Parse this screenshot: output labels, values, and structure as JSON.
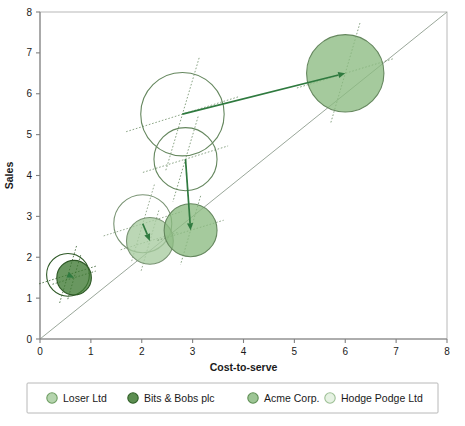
{
  "chart_data": {
    "type": "scatter",
    "title": "",
    "xlabel": "Cost-to-serve",
    "ylabel": "Sales",
    "xlim": [
      0,
      8
    ],
    "ylim": [
      0,
      8
    ],
    "xticks": [
      "0",
      "1",
      "2",
      "3",
      "4",
      "5",
      "6",
      "7",
      "8"
    ],
    "yticks": [
      "0",
      "1",
      "2",
      "3",
      "4",
      "5",
      "6",
      "7",
      "8"
    ],
    "grid": false,
    "legend_position": "bottom",
    "reference_line": {
      "name": "diagonal-parity-line",
      "from": [
        0,
        0
      ],
      "to": [
        8,
        8
      ],
      "color": "#9aa79a"
    },
    "series": [
      {
        "name": "Bits & Bobs plc",
        "color": "#3f7a33",
        "start": {
          "x": 0.55,
          "y": 1.57,
          "r": 0.42,
          "filled": false
        },
        "end": {
          "x": 0.67,
          "y": 1.5,
          "r": 0.34,
          "filled": true
        }
      },
      {
        "name": "Loser Ltd",
        "color": "#a8ccA0",
        "start": {
          "x": 2.02,
          "y": 2.82,
          "r": 0.57,
          "filled": false
        },
        "end": {
          "x": 2.16,
          "y": 2.4,
          "r": 0.46,
          "filled": true
        }
      },
      {
        "name": "Acme Corp.",
        "color": "#8cbb82",
        "start": {
          "x": 2.86,
          "y": 4.4,
          "r": 0.62,
          "filled": false
        },
        "end": {
          "x": 2.96,
          "y": 2.66,
          "r": 0.52,
          "filled": true
        }
      },
      {
        "name": "Acme Corp.",
        "color": "#8cbb82",
        "start": {
          "x": 2.8,
          "y": 5.5,
          "r": 0.82,
          "filled": false
        },
        "end": {
          "x": 6.0,
          "y": 6.5,
          "r": 0.76,
          "filled": true
        }
      }
    ]
  },
  "legend": {
    "items": [
      {
        "label": "Loser Ltd",
        "color": "#a8cca0",
        "stroke": "#6f9e63"
      },
      {
        "label": "Bits & Bobs plc",
        "color": "#3f7a33",
        "stroke": "#2f5f27"
      },
      {
        "label": "Acme Corp.",
        "color": "#8cbb82",
        "stroke": "#5f8f54"
      },
      {
        "label": "Hodge Podge Ltd",
        "color": "#e2f0de",
        "stroke": "#9dbf95"
      }
    ]
  },
  "colors": {
    "axis": "#808080",
    "frame": "#b8b8b8",
    "arrow": "#2f7a3f",
    "reference_line": "#9aa79a",
    "text": "#1a1a1a"
  }
}
